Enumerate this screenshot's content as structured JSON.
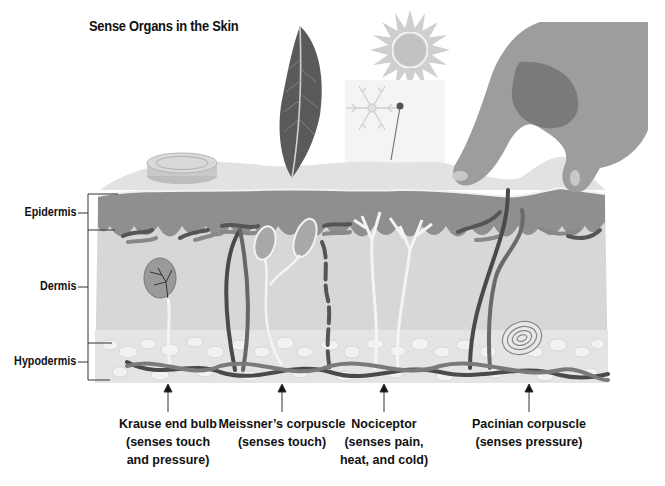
{
  "title": "Sense Organs in the Skin",
  "layers": [
    {
      "label": "Epidermis"
    },
    {
      "label": "Dermis"
    },
    {
      "label": "Hypodermis"
    }
  ],
  "stimuli": [
    "feather",
    "sun",
    "snowflake",
    "pin",
    "coin",
    "hand"
  ],
  "receptors": [
    {
      "name": "Krause end bulb",
      "lines": [
        "Krause end bulb",
        "(senses touch",
        "and pressure)"
      ]
    },
    {
      "name": "Meissner’s corpuscle",
      "lines": [
        "Meissner’s corpuscle",
        "(senses touch)"
      ]
    },
    {
      "name": "Nociceptor",
      "lines": [
        "Nociceptor",
        "(senses pain,",
        "heat, and cold)"
      ]
    },
    {
      "name": "Pacinian corpuscle",
      "lines": [
        "Pacinian corpuscle",
        "(senses pressure)"
      ]
    }
  ],
  "colors": {
    "epidermis": "#8f8f8f",
    "dermis": "#d6d6d6",
    "hypodermis": "#e8e8e8",
    "surface": "#e3e3e3",
    "nerve_dark": "#4a4a4a",
    "nerve_mid": "#7a7a7a",
    "text": "#111111"
  }
}
